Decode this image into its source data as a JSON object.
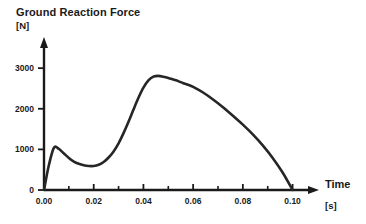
{
  "chart_data": {
    "type": "line",
    "title": "Ground Reaction Force",
    "xlabel": "Time",
    "ylabel": "",
    "x_unit": "[s]",
    "y_unit": "[N]",
    "xlim": [
      0.0,
      0.105
    ],
    "ylim": [
      0,
      3250
    ],
    "grid": false,
    "legend": null,
    "x_ticks": [
      {
        "value": 0.0,
        "label": "0.00"
      },
      {
        "value": 0.02,
        "label": "0.02"
      },
      {
        "value": 0.04,
        "label": "0.04"
      },
      {
        "value": 0.06,
        "label": "0.06"
      },
      {
        "value": 0.08,
        "label": "0.08"
      },
      {
        "value": 0.1,
        "label": "0.10"
      }
    ],
    "x_minor_ticks": [
      0.01,
      0.03,
      0.05,
      0.07,
      0.09
    ],
    "y_ticks": [
      {
        "value": 0,
        "label": "0"
      },
      {
        "value": 1000,
        "label": "1000"
      },
      {
        "value": 2000,
        "label": "2000"
      },
      {
        "value": 3000,
        "label": "3000"
      }
    ],
    "series": [
      {
        "name": "Ground Reaction Force",
        "color": "#262626",
        "x": [
          0.0,
          0.002,
          0.004,
          0.006,
          0.008,
          0.01,
          0.012,
          0.014,
          0.016,
          0.018,
          0.02,
          0.022,
          0.024,
          0.026,
          0.028,
          0.03,
          0.032,
          0.034,
          0.036,
          0.038,
          0.04,
          0.042,
          0.044,
          0.046,
          0.048,
          0.05,
          0.052,
          0.054,
          0.056,
          0.058,
          0.06,
          0.064,
          0.068,
          0.072,
          0.076,
          0.08,
          0.084,
          0.088,
          0.092,
          0.096,
          0.1
        ],
        "y": [
          0,
          620,
          1040,
          1010,
          900,
          790,
          700,
          645,
          610,
          590,
          590,
          620,
          690,
          800,
          950,
          1150,
          1400,
          1680,
          1980,
          2270,
          2520,
          2700,
          2790,
          2810,
          2790,
          2760,
          2720,
          2680,
          2630,
          2590,
          2540,
          2400,
          2230,
          2040,
          1830,
          1610,
          1370,
          1100,
          790,
          430,
          0
        ]
      }
    ],
    "annotations": {
      "first_peak": {
        "x": 0.004,
        "y": 1040
      },
      "local_minimum": {
        "x": 0.019,
        "y": 590
      },
      "main_peak": {
        "x": 0.046,
        "y": 2810
      },
      "touchdown_end": {
        "x": 0.1,
        "y": 0
      }
    }
  },
  "axes": {
    "x_arrow": "arrow-right",
    "y_arrow": "arrow-up"
  }
}
